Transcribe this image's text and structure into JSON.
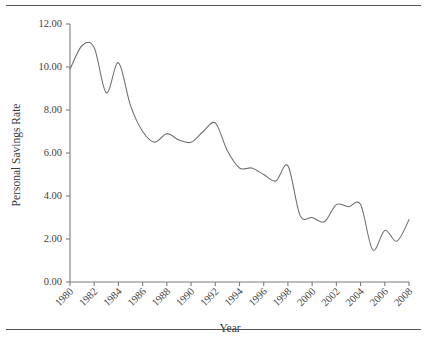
{
  "chart_data": {
    "type": "line",
    "title": "",
    "xlabel": "Year",
    "ylabel": "Personal Savings Rate",
    "xlim": [
      1980,
      2008
    ],
    "ylim": [
      0.0,
      12.0
    ],
    "grid": false,
    "legend": false,
    "y_ticks": [
      "0.00",
      "2.00",
      "4.00",
      "6.00",
      "8.00",
      "10.00",
      "12.00"
    ],
    "y_tick_values": [
      0,
      2,
      4,
      6,
      8,
      10,
      12
    ],
    "x_ticks": [
      "1980",
      "1982",
      "1984",
      "1986",
      "1988",
      "1990",
      "1992",
      "1994",
      "1996",
      "1998",
      "2000",
      "2002",
      "2004",
      "2006",
      "2008"
    ],
    "x_tick_values": [
      1980,
      1982,
      1984,
      1986,
      1988,
      1990,
      1992,
      1994,
      1996,
      1998,
      2000,
      2002,
      2004,
      2006,
      2008
    ],
    "line_color": "#6e6e6e",
    "axis_color": "#7d7d7d",
    "x": [
      1980,
      1981,
      1982,
      1983,
      1984,
      1985,
      1986,
      1987,
      1988,
      1989,
      1990,
      1991,
      1992,
      1993,
      1994,
      1995,
      1996,
      1997,
      1998,
      1999,
      2000,
      2001,
      2002,
      2003,
      2004,
      2005,
      2006,
      2007,
      2008
    ],
    "values": [
      9.9,
      11.0,
      10.9,
      8.8,
      10.2,
      8.2,
      7.0,
      6.5,
      6.9,
      6.6,
      6.5,
      7.0,
      7.4,
      6.1,
      5.3,
      5.3,
      5.0,
      4.7,
      5.4,
      3.1,
      3.0,
      2.8,
      3.6,
      3.5,
      3.6,
      1.5,
      2.4,
      1.9,
      2.9
    ],
    "series": [
      {
        "name": "Personal Savings Rate",
        "values": [
          9.9,
          11.0,
          10.9,
          8.8,
          10.2,
          8.2,
          7.0,
          6.5,
          6.9,
          6.6,
          6.5,
          7.0,
          7.4,
          6.1,
          5.3,
          5.3,
          5.0,
          4.7,
          5.4,
          3.1,
          3.0,
          2.8,
          3.6,
          3.5,
          3.6,
          1.5,
          2.4,
          1.9,
          2.9
        ]
      }
    ]
  }
}
